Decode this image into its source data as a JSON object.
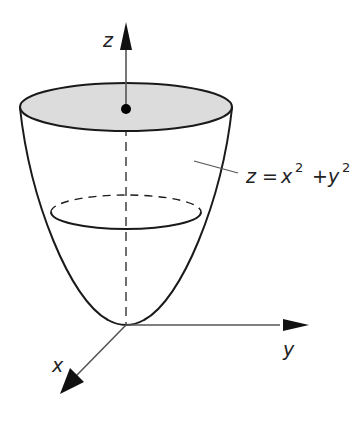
{
  "diagram": {
    "axes": {
      "z": {
        "label": "z"
      },
      "y": {
        "label": "y"
      },
      "x": {
        "label": "x"
      }
    },
    "equation": {
      "lhs": "z",
      "eq": "=",
      "x": "x",
      "x_exp": "2",
      "plus": "+",
      "y": "y",
      "y_exp": "2"
    },
    "colors": {
      "stroke": "#1a1a1a",
      "top_fill": "#dcdcdc",
      "dot": "#000000",
      "background": "#ffffff"
    },
    "elements": [
      "z-axis arrow (up)",
      "y-axis arrow (right)",
      "x-axis arrow (down-left)",
      "paraboloid surface",
      "shaded top ellipse cross-section",
      "point on z-axis at top cross-section",
      "mid-level ellipse cross-section (back half dashed)",
      "dashed hidden z-axis segment inside surface",
      "leader line to equation label"
    ]
  }
}
